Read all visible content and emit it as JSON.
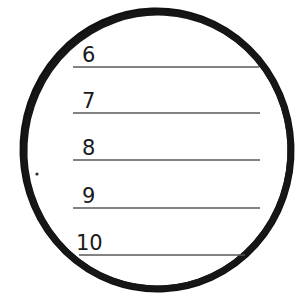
{
  "figure": {
    "background_color": "#ffffff",
    "ink_color": "#111111",
    "rule_color": "#595959"
  },
  "circle": {
    "name": "hand-drawn-circle",
    "center_x": 157,
    "center_y": 150,
    "radius": 134,
    "stroke_width": 7,
    "stroke_color": "#111111",
    "fill": "none"
  },
  "speck": {
    "name": "ink-speck",
    "x": 37,
    "y": 174,
    "radius": 1.6,
    "color": "#2b2b2b"
  },
  "rules": [
    {
      "label": "6",
      "x1": 73,
      "x2": 259,
      "y": 67,
      "label_x": 82,
      "label_y": 45
    },
    {
      "label": "7",
      "x1": 73,
      "x2": 260,
      "y": 113,
      "label_x": 82,
      "label_y": 91
    },
    {
      "label": "8",
      "x1": 73,
      "x2": 260,
      "y": 160,
      "label_x": 82,
      "label_y": 138
    },
    {
      "label": "9",
      "x1": 73,
      "x2": 260,
      "y": 208,
      "label_x": 82,
      "label_y": 186
    },
    {
      "label": "10",
      "x1": 79,
      "x2": 245,
      "y": 255,
      "label_x": 76,
      "label_y": 233
    }
  ]
}
